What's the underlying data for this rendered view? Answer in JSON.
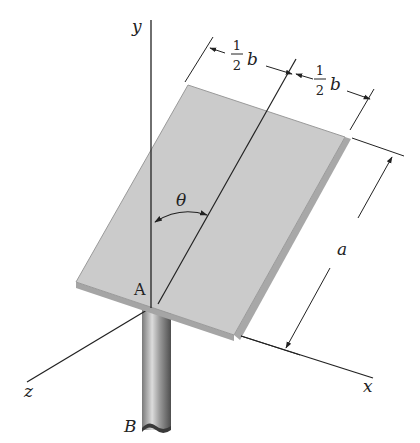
{
  "diagram": {
    "type": "rigid-body plate on shaft",
    "axes": {
      "y_label": "y",
      "x_label": "x",
      "z_label": "z"
    },
    "points": {
      "origin_label": "A",
      "shaft_end_label": "B"
    },
    "dimensions": {
      "half_width_left_num": "1",
      "half_width_left_den": "2",
      "half_width_left_var": "b",
      "half_width_right_num": "1",
      "half_width_right_den": "2",
      "half_width_right_var": "b",
      "length_label": "a",
      "angle_label": "θ"
    },
    "colors": {
      "plate_fill": "#c9c9c9",
      "plate_edge": "#9a9a9a",
      "line": "#222222",
      "shaft_dark": "#6e6e6e",
      "shaft_light": "#d8d8d8"
    }
  }
}
